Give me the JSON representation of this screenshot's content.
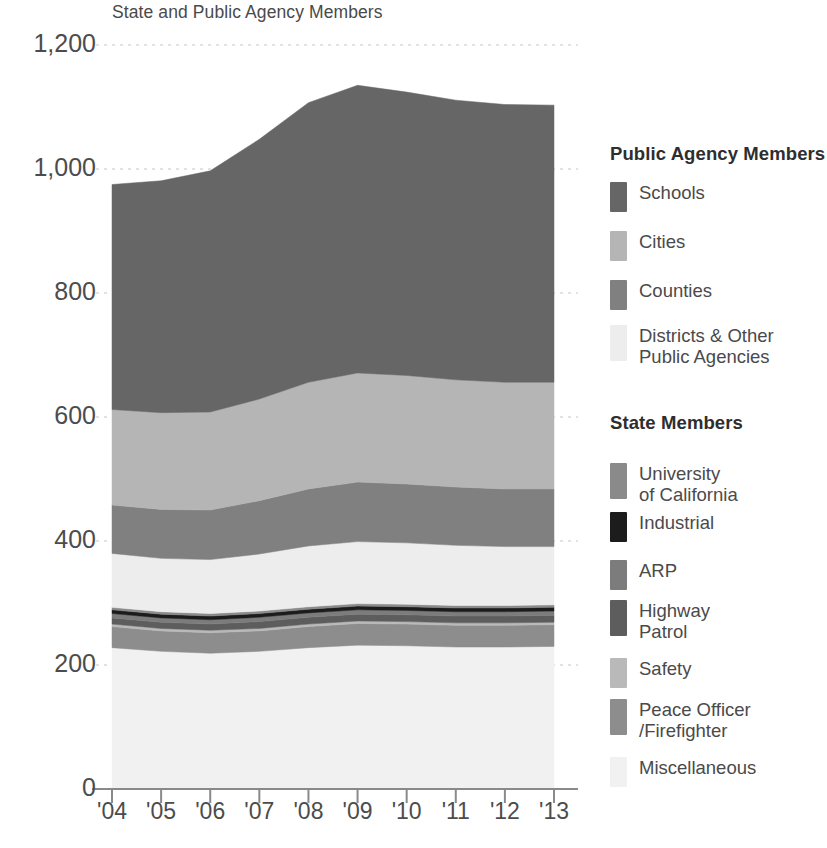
{
  "chart_data": {
    "type": "area",
    "title": "State and Public Agency Members",
    "subtitle": "State and Public Agency Members",
    "xlabel": "",
    "ylabel": "",
    "stacked": true,
    "grid": true,
    "legend_position": "right",
    "ylim": [
      0,
      1200
    ],
    "yticks": [
      0,
      200,
      400,
      600,
      800,
      1000,
      1200
    ],
    "ytick_labels": [
      "0",
      "200",
      "400",
      "600",
      "800",
      "1,000",
      "1,200"
    ],
    "categories": [
      "'04",
      "'05",
      "'06",
      "'07",
      "'08",
      "'09",
      "'10",
      "'11",
      "'12",
      "'13"
    ],
    "x": [
      "2004",
      "2005",
      "2006",
      "2007",
      "2008",
      "2009",
      "2010",
      "2011",
      "2012",
      "2013"
    ],
    "stack_order_bottom_to_top": [
      "Miscellaneous",
      "Peace Officer/Firefighter",
      "Safety",
      "Highway Patrol",
      "ARP",
      "Industrial",
      "University of California",
      "Districts & Other Public Agencies",
      "Counties",
      "Cities",
      "Schools"
    ],
    "series": [
      {
        "name": "Miscellaneous",
        "group": "State Members",
        "color": "#f1f1f1",
        "values": [
          228,
          222,
          219,
          222,
          228,
          232,
          231,
          229,
          229,
          230
        ]
      },
      {
        "name": "Peace Officer/Firefighter",
        "group": "State Members",
        "color": "#8d8d8d",
        "values": [
          34,
          33,
          33,
          33,
          34,
          35,
          35,
          35,
          35,
          35
        ]
      },
      {
        "name": "Safety",
        "group": "State Members",
        "color": "#b9b9b9",
        "values": [
          4,
          4,
          4,
          4,
          4,
          4,
          4,
          4,
          4,
          4
        ]
      },
      {
        "name": "Highway Patrol",
        "group": "State Members",
        "color": "#5d5d5d",
        "values": [
          10,
          10,
          10,
          11,
          11,
          11,
          11,
          11,
          11,
          11
        ]
      },
      {
        "name": "ARP",
        "group": "State Members",
        "color": "#7c7c7c",
        "values": [
          7,
          7,
          7,
          7,
          7,
          7,
          7,
          7,
          7,
          7
        ]
      },
      {
        "name": "Industrial",
        "group": "State Members",
        "color": "#1c1c1c",
        "values": [
          6,
          6,
          6,
          6,
          6,
          6,
          6,
          6,
          6,
          6
        ]
      },
      {
        "name": "University of California",
        "group": "State Members",
        "color": "#8a8a8a",
        "values": [
          4,
          4,
          4,
          4,
          4,
          4,
          4,
          4,
          4,
          4
        ]
      },
      {
        "name": "Districts & Other Public Agencies",
        "group": "Public Agency Members",
        "color": "#ededed",
        "values": [
          87,
          86,
          87,
          92,
          98,
          100,
          99,
          97,
          95,
          94
        ]
      },
      {
        "name": "Counties",
        "group": "Public Agency Members",
        "color": "#808080",
        "values": [
          78,
          79,
          80,
          86,
          92,
          96,
          95,
          94,
          93,
          93
        ]
      },
      {
        "name": "Cities",
        "group": "Public Agency Members",
        "color": "#b5b5b5",
        "values": [
          154,
          156,
          158,
          164,
          172,
          176,
          175,
          173,
          172,
          172
        ]
      },
      {
        "name": "Schools",
        "group": "Public Agency Members",
        "color": "#666666",
        "values": [
          363,
          374,
          389,
          419,
          451,
          464,
          457,
          451,
          448,
          447
        ]
      }
    ],
    "totals": [
      975,
      981,
      997,
      1048,
      1107,
      1135,
      1124,
      1111,
      1104,
      1103
    ]
  },
  "axis": {
    "y_labels": [
      "1,200",
      "1,000",
      "800",
      "600",
      "400",
      "200",
      "0"
    ],
    "x_labels": [
      "'04",
      "'05",
      "'06",
      "'07",
      "'08",
      "'09",
      "'10",
      "'11",
      "'12",
      "'13"
    ]
  },
  "legend": {
    "groups": [
      {
        "title": "Public Agency Members",
        "items": [
          {
            "label": "Schools",
            "color": "#666666"
          },
          {
            "label": "Cities",
            "color": "#b5b5b5"
          },
          {
            "label": "Counties",
            "color": "#808080"
          },
          {
            "label": "Districts & Other\nPublic Agencies",
            "color": "#ededed"
          }
        ]
      },
      {
        "title": "State Members",
        "items": [
          {
            "label": "University\nof California",
            "color": "#8a8a8a"
          },
          {
            "label": "Industrial",
            "color": "#1c1c1c"
          },
          {
            "label": "ARP",
            "color": "#7c7c7c"
          },
          {
            "label": "Highway\nPatrol",
            "color": "#5d5d5d"
          },
          {
            "label": "Safety",
            "color": "#b9b9b9"
          },
          {
            "label": "Peace Officer\n/Firefighter",
            "color": "#8d8d8d"
          },
          {
            "label": "Miscellaneous",
            "color": "#f1f1f1"
          }
        ]
      }
    ]
  },
  "colors": {
    "axis_line": "#8a8a8a",
    "grid_line": "#e2e2e2",
    "text": "#4a4a4a",
    "heading": "#2e2e2e",
    "background": "#ffffff"
  }
}
